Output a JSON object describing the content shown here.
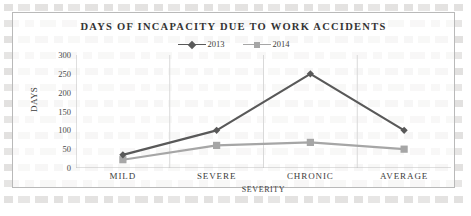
{
  "chart_data": {
    "type": "line",
    "title": "DAYS OF INCAPACITY DUE TO WORK ACCIDENTS",
    "xlabel": "SEVERITY",
    "ylabel": "DAYS",
    "categories": [
      "MILD",
      "SEVERE",
      "CHRONIC",
      "AVERAGE"
    ],
    "series": [
      {
        "name": "2013",
        "values": [
          35,
          100,
          250,
          100
        ],
        "color": "#595959",
        "marker": "diamond"
      },
      {
        "name": "2014",
        "values": [
          22,
          60,
          68,
          50
        ],
        "color": "#a6a6a6",
        "marker": "square"
      }
    ],
    "ylim": [
      0,
      300
    ],
    "yticks": [
      0,
      50,
      100,
      150,
      200,
      250,
      300
    ],
    "ytick_labels": [
      "0",
      "50",
      "100",
      "150",
      "200",
      "250",
      "300"
    ],
    "grid": "vertical-only",
    "legend_position": "top-center"
  }
}
